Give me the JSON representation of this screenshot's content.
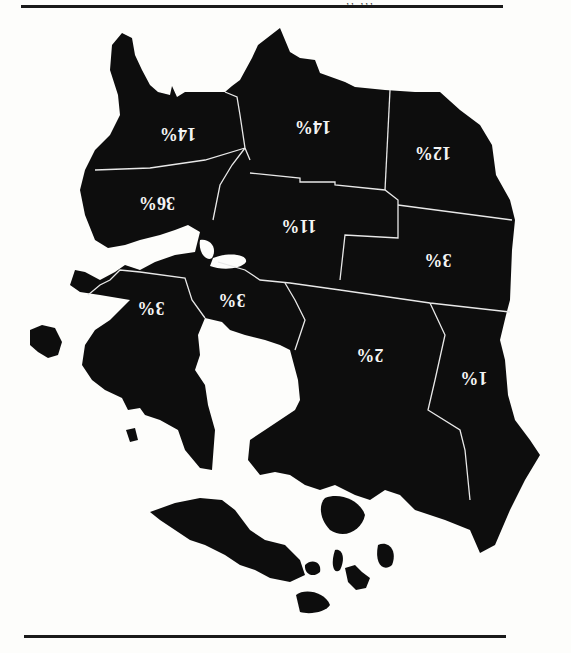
{
  "page": {
    "orientation": "rotated-180",
    "header_fragment": "' ' ' ,, ,,, ''"
  },
  "map": {
    "type": "choropleth",
    "fill_color": "#0d0d0d",
    "border_color": "#e8e8e8",
    "label_color": "#f4f4f4",
    "regions": [
      {
        "id": "northwest-peninsula",
        "label": "14%"
      },
      {
        "id": "north-central",
        "label": "14%"
      },
      {
        "id": "northeast",
        "label": "12%"
      },
      {
        "id": "west",
        "label": "36%"
      },
      {
        "id": "central",
        "label": "11%"
      },
      {
        "id": "east-central",
        "label": "3%"
      },
      {
        "id": "southwest",
        "label": "3%"
      },
      {
        "id": "south-central-west",
        "label": "3%"
      },
      {
        "id": "south",
        "label": "2%"
      },
      {
        "id": "southeast",
        "label": "1%"
      }
    ]
  }
}
